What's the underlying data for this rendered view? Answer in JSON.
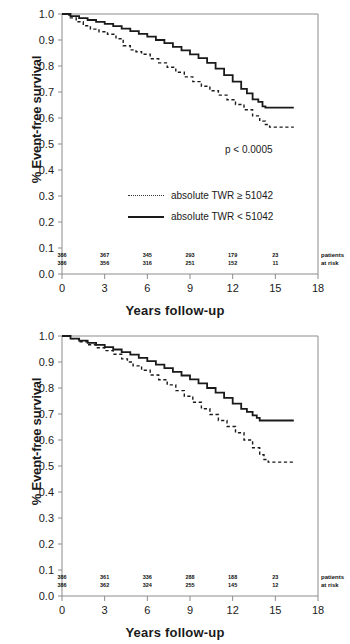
{
  "chart_data": [
    {
      "type": "line",
      "title": "",
      "xlabel": "Years follow-up",
      "ylabel": "% Event-free survival",
      "xlim": [
        0,
        18
      ],
      "ylim": [
        0,
        1.0
      ],
      "xticks": [
        "0",
        "3",
        "6",
        "9",
        "12",
        "15",
        "18"
      ],
      "yticks": [
        "0.0",
        "0.1",
        "0.2",
        "0.3",
        "0.4",
        "0.5",
        "0.6",
        "0.7",
        "0.8",
        "0.9",
        "1.0"
      ],
      "grid": false,
      "legend_position": "center",
      "annotation": "p < 0.0005",
      "risk_caption_line1": "patients",
      "risk_caption_line2": "at risk",
      "risk_times": [
        0,
        3,
        6,
        9,
        12,
        15
      ],
      "series": [
        {
          "name": "absolute TWR ≥ 51042",
          "style": "dotted",
          "at_risk": [
            "386",
            "367",
            "345",
            "293",
            "179",
            "23"
          ],
          "x": [
            0,
            0.5,
            1.0,
            1.5,
            2.0,
            2.6,
            3.2,
            3.8,
            4.3,
            4.8,
            5.2,
            5.6,
            6.2,
            6.8,
            7.4,
            8.0,
            8.6,
            9.2,
            9.8,
            10.4,
            11.0,
            11.6,
            12.2,
            12.8,
            13.4,
            13.9,
            14.3,
            14.6,
            16.3
          ],
          "y": [
            1.0,
            0.985,
            0.97,
            0.955,
            0.942,
            0.932,
            0.922,
            0.905,
            0.878,
            0.862,
            0.855,
            0.845,
            0.828,
            0.812,
            0.795,
            0.776,
            0.758,
            0.74,
            0.722,
            0.705,
            0.688,
            0.67,
            0.652,
            0.632,
            0.608,
            0.588,
            0.575,
            0.565,
            0.565
          ]
        },
        {
          "name": "absolute TWR < 51042",
          "style": "solid",
          "at_risk": [
            "386",
            "356",
            "316",
            "251",
            "152",
            "11"
          ],
          "x": [
            0,
            0.6,
            1.2,
            1.8,
            2.4,
            3.0,
            3.6,
            4.2,
            4.8,
            5.4,
            6.0,
            6.6,
            7.2,
            7.8,
            8.4,
            9.0,
            9.6,
            10.2,
            10.8,
            11.4,
            12.0,
            12.6,
            13.0,
            13.4,
            13.8,
            14.1,
            14.3,
            16.3
          ],
          "y": [
            1.0,
            0.992,
            0.984,
            0.977,
            0.97,
            0.962,
            0.953,
            0.944,
            0.934,
            0.924,
            0.913,
            0.9,
            0.888,
            0.874,
            0.86,
            0.845,
            0.83,
            0.812,
            0.79,
            0.765,
            0.74,
            0.712,
            0.695,
            0.672,
            0.662,
            0.645,
            0.64,
            0.64
          ]
        }
      ]
    },
    {
      "type": "line",
      "title": "",
      "xlabel": "Years follow-up",
      "ylabel": "% Event-free survival",
      "xlim": [
        0,
        18
      ],
      "ylim": [
        0,
        1.0
      ],
      "xticks": [
        "0",
        "3",
        "6",
        "9",
        "12",
        "15",
        "18"
      ],
      "yticks": [
        "0.0",
        "0.1",
        "0.2",
        "0.3",
        "0.4",
        "0.5",
        "0.6",
        "0.7",
        "0.8",
        "0.9",
        "1.0"
      ],
      "grid": false,
      "legend_position": "center",
      "annotation": "p < 0.0002",
      "risk_caption_line1": "patients",
      "risk_caption_line2": "at risk",
      "risk_times": [
        0,
        3,
        6,
        9,
        12,
        15
      ],
      "series": [
        {
          "name": "relative TWR ≥ 0.15 %",
          "style": "dotted",
          "at_risk": [
            "386",
            "361",
            "336",
            "288",
            "188",
            "23"
          ],
          "x": [
            0,
            0.6,
            1.2,
            1.8,
            2.4,
            3.0,
            3.6,
            4.2,
            4.6,
            5.0,
            5.6,
            6.2,
            6.8,
            7.4,
            8.0,
            8.6,
            9.2,
            9.8,
            10.4,
            11.0,
            11.6,
            12.2,
            12.8,
            13.4,
            13.9,
            14.2,
            14.5,
            16.3
          ],
          "y": [
            1.0,
            0.99,
            0.978,
            0.966,
            0.955,
            0.944,
            0.93,
            0.912,
            0.9,
            0.885,
            0.868,
            0.85,
            0.832,
            0.812,
            0.79,
            0.768,
            0.745,
            0.72,
            0.698,
            0.675,
            0.652,
            0.628,
            0.6,
            0.57,
            0.543,
            0.525,
            0.515,
            0.515
          ]
        },
        {
          "name": "relative TWR < 0.15 %",
          "style": "solid",
          "at_risk": [
            "386",
            "362",
            "324",
            "255",
            "145",
            "12"
          ],
          "x": [
            0,
            0.6,
            1.2,
            1.8,
            2.4,
            3.0,
            3.6,
            4.2,
            4.8,
            5.4,
            6.0,
            6.6,
            7.2,
            7.8,
            8.4,
            9.0,
            9.6,
            10.2,
            10.8,
            11.4,
            12.0,
            12.6,
            13.0,
            13.4,
            13.7,
            13.9,
            16.3
          ],
          "y": [
            1.0,
            0.99,
            0.982,
            0.974,
            0.966,
            0.957,
            0.948,
            0.938,
            0.928,
            0.916,
            0.903,
            0.89,
            0.876,
            0.862,
            0.848,
            0.833,
            0.818,
            0.8,
            0.782,
            0.762,
            0.74,
            0.72,
            0.708,
            0.695,
            0.685,
            0.675,
            0.675
          ]
        }
      ]
    }
  ]
}
